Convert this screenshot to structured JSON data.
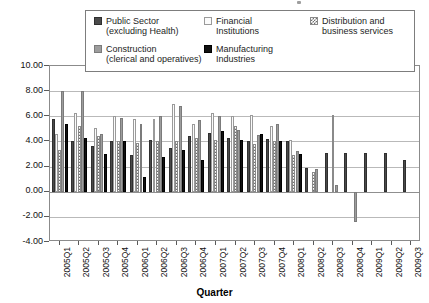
{
  "chart_data": {
    "type": "bar",
    "title": "",
    "xlabel": "Quarter",
    "ylabel": "",
    "ylim": [
      -4.0,
      10.0
    ],
    "ytick_step": 2.0,
    "grid": true,
    "legend_position": "top",
    "categories": [
      "2005Q1",
      "2005Q2",
      "2005Q3",
      "2005Q4",
      "2006Q1",
      "2006Q2",
      "2006Q3",
      "2006Q4",
      "2007Q1",
      "2007Q2",
      "2007Q3",
      "2007Q4",
      "2008Q1",
      "2008Q2",
      "2008Q3",
      "2008Q4",
      "2009Q1",
      "2009Q2",
      "2009Q3"
    ],
    "ytick_labels": [
      "10.00",
      "8.00",
      "6.00",
      "4.00",
      "2.00",
      "0.00",
      "-2.00",
      "-4.00"
    ],
    "ytick_values": [
      10.0,
      8.0,
      6.0,
      4.0,
      2.0,
      0.0,
      -2.0,
      -4.0
    ],
    "series": [
      {
        "name": "Public Sector (excluding Health)",
        "key": "public",
        "color": "#4a4a4a",
        "values": [
          5.8,
          4.0,
          3.6,
          4.0,
          2.9,
          4.1,
          3.5,
          4.4,
          4.7,
          4.3,
          4.0,
          4.2,
          4.0,
          1.9,
          3.1,
          3.1,
          3.1,
          3.1,
          2.5
        ]
      },
      {
        "name": "Financial Institutions",
        "key": "financial",
        "color": "#fbfbfb",
        "values": [
          4.6,
          6.3,
          5.1,
          6.0,
          5.8,
          5.8,
          7.0,
          5.4,
          6.3,
          6.0,
          6.1,
          5.2,
          4.1,
          null,
          null,
          null,
          null,
          null,
          null
        ]
      },
      {
        "name": "Distribution and business services",
        "key": "distribution",
        "color": "#6f6f6f",
        "values": [
          3.3,
          5.2,
          4.4,
          4.0,
          3.9,
          4.0,
          4.0,
          4.3,
          4.1,
          5.2,
          3.8,
          4.0,
          2.9,
          1.6,
          6.1,
          null,
          null,
          null,
          null
        ]
      },
      {
        "name": "Construction (clerical and operatives)",
        "key": "construction",
        "color": "#9d9d9d",
        "values": [
          8.0,
          8.0,
          4.6,
          5.9,
          5.4,
          6.0,
          6.8,
          5.7,
          6.0,
          4.9,
          4.5,
          5.4,
          3.2,
          1.8,
          0.5,
          -2.4,
          null,
          null,
          null
        ]
      },
      {
        "name": "Manufacturing Industries",
        "key": "manufacturing",
        "color": "#111111",
        "values": [
          5.4,
          4.3,
          3.0,
          4.0,
          1.2,
          2.8,
          3.3,
          2.5,
          4.8,
          4.1,
          4.6,
          4.0,
          3.0,
          null,
          null,
          null,
          null,
          null,
          null
        ]
      }
    ]
  },
  "legend": {
    "items": [
      {
        "label": "Public Sector\n(excluding Health)",
        "swatch": "public"
      },
      {
        "label": "Financial\nInstitutions",
        "swatch": "financial"
      },
      {
        "label": "Distribution and\nbusiness services",
        "swatch": "distribution"
      },
      {
        "label": "Construction\n(clerical and operatives)",
        "swatch": "construction"
      },
      {
        "label": "Manufacturing\nIndustries",
        "swatch": "manufacturing"
      }
    ]
  },
  "axis": {
    "x_title": "Quarter"
  }
}
